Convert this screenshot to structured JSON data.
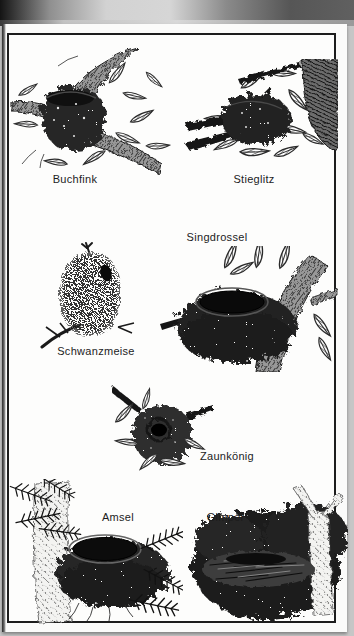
{
  "figures": [
    {
      "name": "buchfink",
      "label": "Buchfink"
    },
    {
      "name": "stieglitz",
      "label": "Stieglitz"
    },
    {
      "name": "schwanzmeise",
      "label": "Schwanzmeise"
    },
    {
      "name": "singdrossel",
      "label": "Singdrossel"
    },
    {
      "name": "zaunkoenig",
      "label": "Zaunkönig"
    },
    {
      "name": "amsel",
      "label": "Amsel"
    },
    {
      "name": "gimpel",
      "label": "Gimpel"
    }
  ],
  "colors": {
    "scan_background": "#c6c6c6",
    "page": "#fbfbfa",
    "frame_border": "#1d1d1d",
    "ink": "#1c1c1c"
  }
}
